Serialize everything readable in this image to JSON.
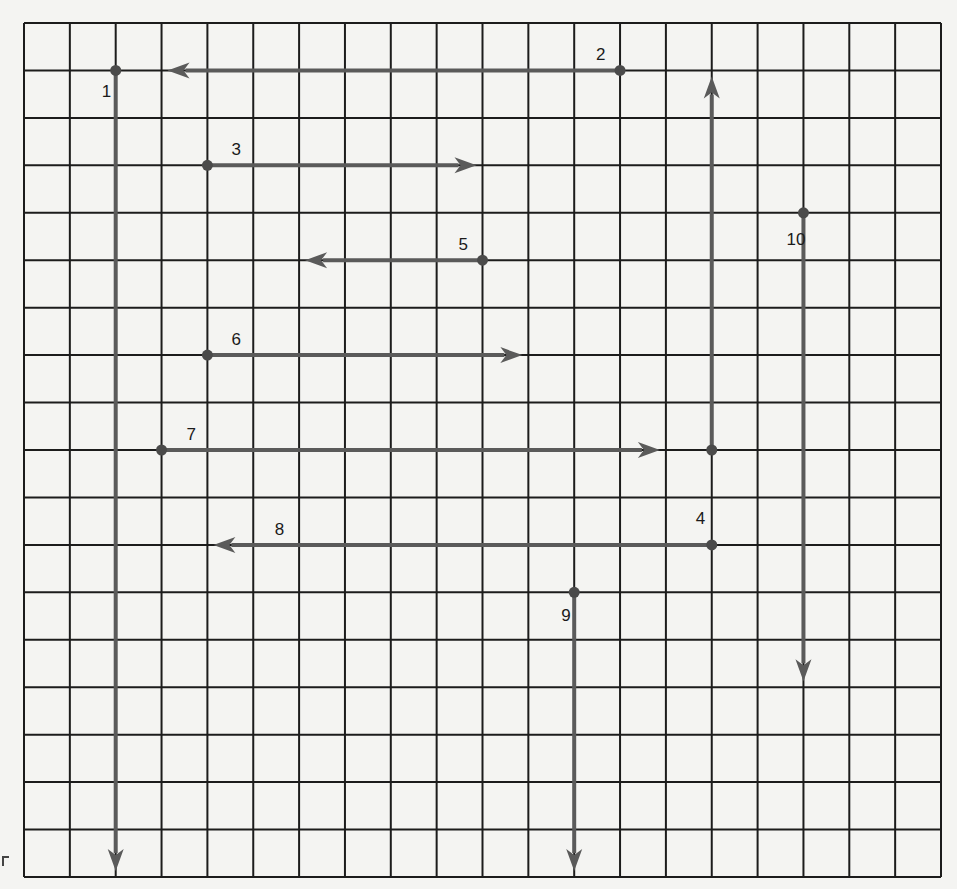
{
  "diagram": {
    "grid": {
      "columns": 20,
      "rows": 18,
      "left": 24,
      "top": 23,
      "right": 941,
      "bottom": 877
    },
    "colors": {
      "background": "#f4f4f2",
      "grid_line": "#1c1c1c",
      "vector": "#5a5a5a",
      "origin_dot": "#4a4a4a",
      "label": "#1a1a1a"
    },
    "vectors": [
      {
        "label": "1",
        "start": [
          2,
          1
        ],
        "end": [
          2,
          18
        ],
        "direction": "down",
        "label_offset": [
          -14,
          27
        ]
      },
      {
        "label": "2",
        "start": [
          13,
          1
        ],
        "end": [
          3,
          1
        ],
        "direction": "left",
        "label_offset": [
          -24,
          -10
        ]
      },
      {
        "label": "3",
        "start": [
          4,
          3
        ],
        "end": [
          10,
          3
        ],
        "direction": "right",
        "label_offset": [
          24,
          -10
        ]
      },
      {
        "label": "4",
        "start": [
          15,
          9
        ],
        "end": [
          15,
          1
        ],
        "direction": "up",
        "label_offset": [
          -16,
          74
        ]
      },
      {
        "label": "5",
        "start": [
          10,
          5
        ],
        "end": [
          6,
          5
        ],
        "direction": "left",
        "label_offset": [
          -24,
          -10
        ]
      },
      {
        "label": "6",
        "start": [
          4,
          7
        ],
        "end": [
          11,
          7
        ],
        "direction": "right",
        "label_offset": [
          24,
          -10
        ]
      },
      {
        "label": "7",
        "start": [
          3,
          9
        ],
        "end": [
          14,
          9
        ],
        "direction": "right",
        "label_offset": [
          25,
          -10
        ]
      },
      {
        "label": "8",
        "start": [
          15,
          11
        ],
        "end": [
          4,
          11
        ],
        "direction": "left",
        "label_offset": [
          -437,
          -10
        ]
      },
      {
        "label": "9",
        "start": [
          12,
          12
        ],
        "end": [
          12,
          18
        ],
        "direction": "down",
        "label_offset": [
          -13,
          29
        ]
      },
      {
        "label": "10",
        "start": [
          17,
          4
        ],
        "end": [
          17,
          14
        ],
        "direction": "down",
        "label_offset": [
          -17,
          32
        ]
      }
    ]
  }
}
